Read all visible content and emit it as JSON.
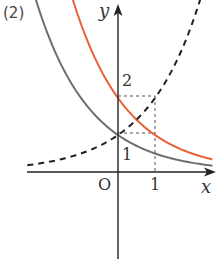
{
  "problem_label": "(2)",
  "labels": {
    "y_axis": "y",
    "x_axis": "x",
    "origin": "O",
    "x_tick_1": "1",
    "y_tick_1": "1",
    "y_tick_2": "2"
  },
  "colors": {
    "axis": "#222222",
    "gray_curve": "#6e6e6e",
    "orange_curve": "#e8613a",
    "dashed_curve": "#222222",
    "guide_lines": "#555555"
  },
  "chart_data": {
    "type": "line",
    "title": "(2)",
    "xlabel": "x",
    "ylabel": "y",
    "xlim": [
      -2.4,
      2.6
    ],
    "ylim": [
      -2.3,
      4.6
    ],
    "grid": false,
    "legend": null,
    "ticks": {
      "x": [
        "O",
        "1"
      ],
      "y": [
        "1",
        "2"
      ]
    },
    "guides": [
      {
        "from": [
          0,
          2
        ],
        "to": [
          1,
          2
        ],
        "style": "dashed"
      },
      {
        "from": [
          0,
          1
        ],
        "to": [
          1,
          1
        ],
        "style": "dashed"
      },
      {
        "from": [
          1,
          0
        ],
        "to": [
          1,
          2
        ],
        "style": "dashed"
      }
    ],
    "series": [
      {
        "name": "y = (1/2)^x",
        "style": "solid",
        "color": "#6e6e6e",
        "x": [
          -2.2,
          -1.5,
          -1,
          -0.5,
          0,
          0.5,
          1,
          1.5,
          2,
          2.5
        ],
        "y": [
          4.59,
          2.83,
          2,
          1.41,
          1,
          0.71,
          0.5,
          0.35,
          0.25,
          0.18
        ]
      },
      {
        "name": "y = 2·(1/2)^x",
        "style": "solid",
        "color": "#e8613a",
        "x": [
          -1.2,
          -1,
          -0.5,
          0,
          0.5,
          1,
          1.5,
          2,
          2.5
        ],
        "y": [
          4.59,
          4,
          2.83,
          2,
          1.41,
          1,
          0.71,
          0.5,
          0.35
        ]
      },
      {
        "name": "y = 2^x",
        "style": "dashed",
        "color": "#222222",
        "x": [
          -2.4,
          -2,
          -1.5,
          -1,
          -0.5,
          0,
          0.5,
          1,
          1.5,
          2,
          2.2
        ],
        "y": [
          0.19,
          0.25,
          0.35,
          0.5,
          0.71,
          1,
          1.41,
          2,
          2.83,
          4,
          4.59
        ]
      }
    ]
  }
}
